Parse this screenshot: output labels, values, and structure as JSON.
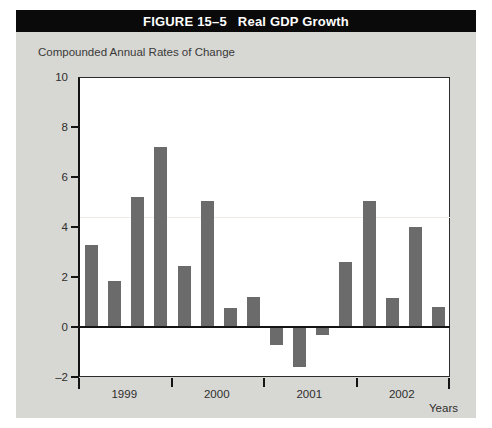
{
  "figure": {
    "label": "FIGURE 15–5",
    "title": "Real GDP Growth",
    "subtitle": "Compounded Annual Rates of Change",
    "axis_note": "Years",
    "colors": {
      "banner_background": "#0a0a0a",
      "banner_text": "#ffffff",
      "figure_background": "#d7d7d4",
      "plot_background": "#ffffff",
      "bar_fill": "#6b6b6b",
      "axis": "#141414"
    }
  },
  "chart_data": {
    "type": "bar",
    "title": "Real GDP Growth",
    "subtitle": "Compounded Annual Rates of Change",
    "xlabel": "Years",
    "ylabel": "Compounded Annual Rates of Change",
    "ylim": [
      -2,
      10
    ],
    "yticks": [
      10,
      8,
      6,
      4,
      2,
      0,
      -2
    ],
    "ytick_labels": [
      "10",
      "8",
      "6",
      "4",
      "2",
      "0",
      "–2"
    ],
    "grid": false,
    "legend": "none",
    "group_labels": [
      "1999",
      "2000",
      "2001",
      "2002"
    ],
    "categories": [
      "1999 Q1",
      "1999 Q2",
      "1999 Q3",
      "1999 Q4",
      "2000 Q1",
      "2000 Q2",
      "2000 Q3",
      "2000 Q4",
      "2001 Q1",
      "2001 Q2",
      "2001 Q3",
      "2001 Q4",
      "2002 Q1",
      "2002 Q2",
      "2002 Q3",
      "2002 Q4"
    ],
    "values": [
      3.3,
      1.85,
      5.2,
      7.2,
      2.45,
      5.05,
      0.75,
      1.2,
      -0.7,
      -1.6,
      -0.3,
      2.6,
      5.05,
      1.15,
      4.0,
      0.8
    ]
  }
}
